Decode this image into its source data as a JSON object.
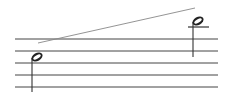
{
  "score": {
    "staff": {
      "line_count": 5,
      "line_y": [
        39,
        51,
        63,
        75,
        87
      ],
      "x_start": 15,
      "x_end": 218,
      "color": "#444444"
    },
    "notes": [
      {
        "type": "half-note",
        "cx": 37,
        "cy": 57,
        "stem": "down",
        "stem_x": 32,
        "stem_y1": 58,
        "stem_y2": 92,
        "ledger": false
      },
      {
        "type": "half-note",
        "cx": 198,
        "cy": 21,
        "stem": "down",
        "stem_x": 193,
        "stem_y1": 22,
        "stem_y2": 57,
        "ledger": true,
        "ledger_y": 27,
        "ledger_x1": 188,
        "ledger_x2": 209
      }
    ],
    "glissando": {
      "x1": 38,
      "y1": 43,
      "x2": 195,
      "y2": 8,
      "color": "#888888"
    }
  }
}
